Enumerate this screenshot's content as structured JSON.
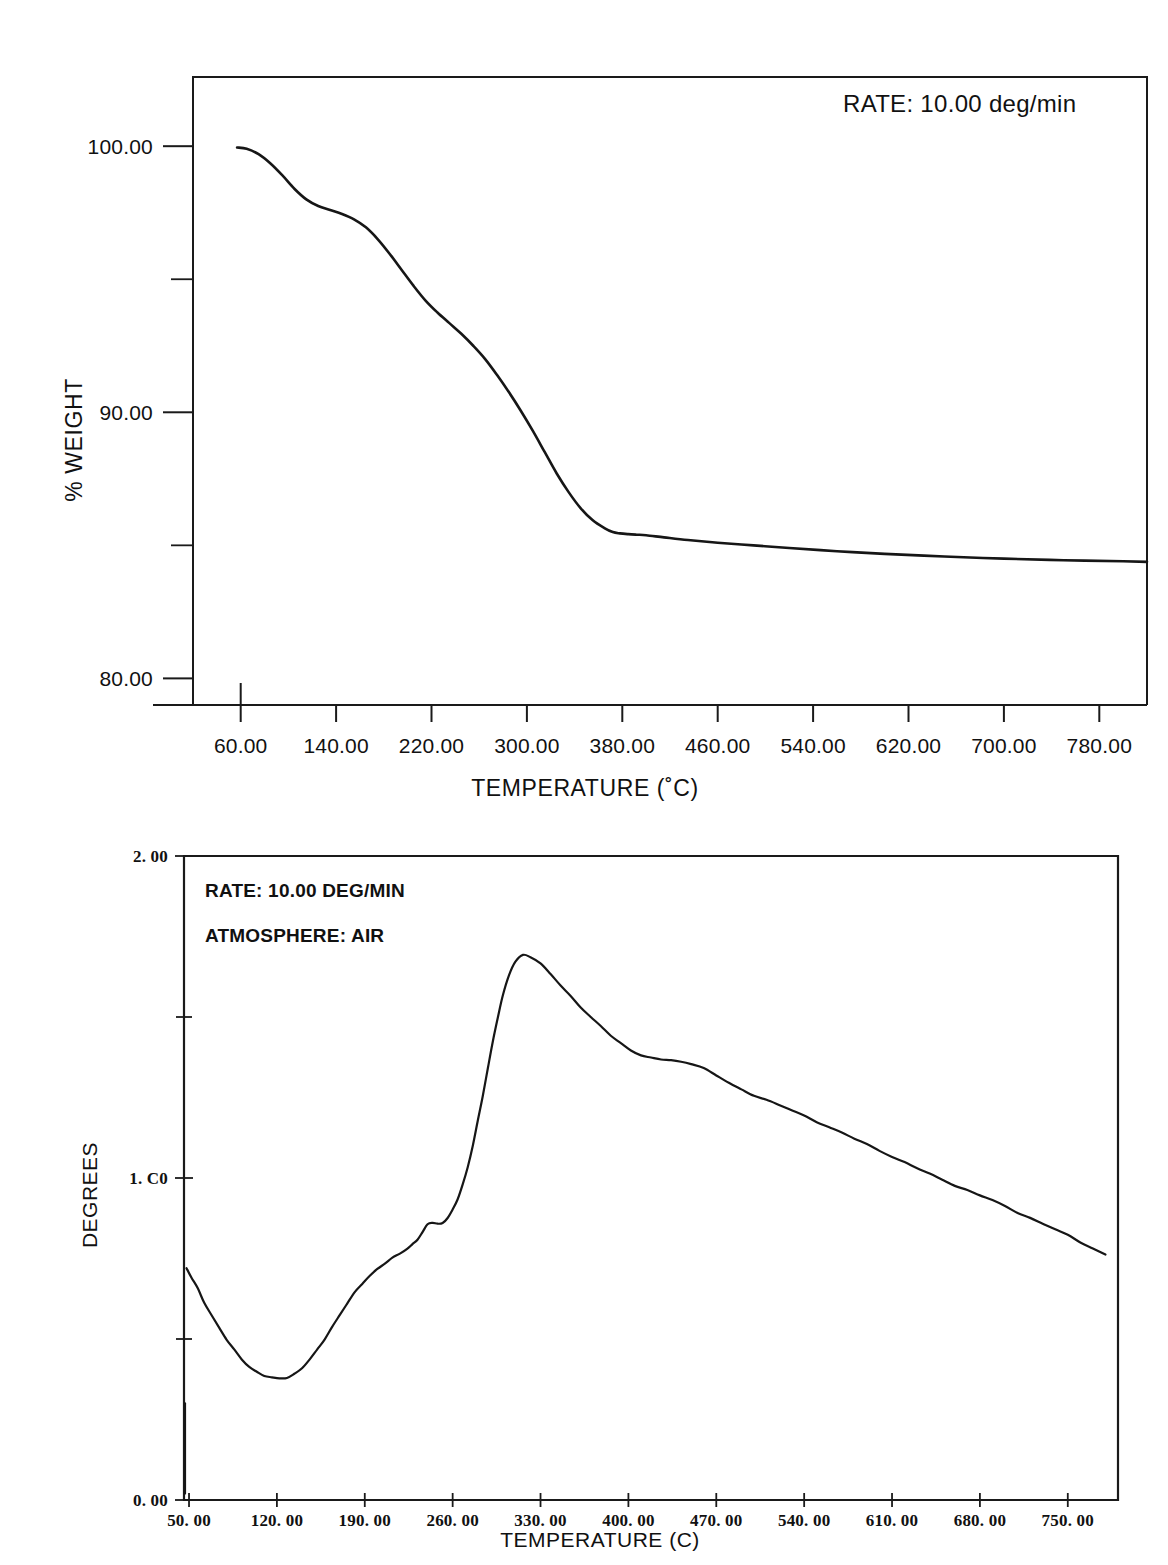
{
  "figure": {
    "background": "#ffffff",
    "ink": "#161616"
  },
  "chart_data": [
    {
      "id": "tga",
      "type": "line",
      "title": "",
      "xlabel": "TEMPERATURE  (˚C)",
      "ylabel": "% WEIGHT",
      "xlim": [
        20,
        820
      ],
      "ylim": [
        79.0,
        102.6
      ],
      "grid": false,
      "legend": "none",
      "annotations": [
        {
          "name": "rate",
          "label": "RATE:",
          "value": "10.00  deg/min",
          "text": "RATE:     10.00  deg/min"
        }
      ],
      "xticks": [
        60,
        140,
        220,
        300,
        380,
        460,
        540,
        620,
        700,
        780
      ],
      "xticklabels": [
        "60.00",
        "140.00",
        "220.00",
        "300.00",
        "380.00",
        "460.00",
        "540.00",
        "620.00",
        "700.00",
        "780.00"
      ],
      "yticks": [
        80,
        90,
        100
      ],
      "yticklabels": [
        "80.00",
        "90.00",
        "100.00"
      ],
      "yminorticks": [
        85,
        95
      ],
      "series": [
        {
          "name": "weight-loss",
          "x": [
            57,
            65,
            75,
            85,
            95,
            105,
            115,
            125,
            135,
            145,
            155,
            165,
            175,
            185,
            195,
            205,
            215,
            225,
            235,
            245,
            255,
            265,
            275,
            285,
            295,
            305,
            315,
            325,
            335,
            345,
            355,
            365,
            372,
            378,
            385,
            392,
            400,
            415,
            435,
            460,
            490,
            520,
            560,
            600,
            650,
            700,
            750,
            800,
            820
          ],
          "y": [
            99.95,
            99.9,
            99.7,
            99.35,
            98.9,
            98.4,
            98.0,
            97.75,
            97.6,
            97.45,
            97.25,
            96.95,
            96.5,
            95.95,
            95.35,
            94.75,
            94.2,
            93.75,
            93.35,
            92.95,
            92.5,
            92.0,
            91.4,
            90.75,
            90.05,
            89.3,
            88.5,
            87.7,
            87.0,
            86.4,
            85.95,
            85.65,
            85.5,
            85.45,
            85.42,
            85.4,
            85.38,
            85.3,
            85.2,
            85.1,
            85.0,
            84.9,
            84.78,
            84.68,
            84.58,
            84.5,
            84.44,
            84.4,
            84.38
          ]
        }
      ]
    },
    {
      "id": "dta",
      "type": "line",
      "title": "",
      "xlabel": "TEMPERATURE (C)",
      "ylabel": "DEGREES",
      "xlim": [
        46,
        790
      ],
      "ylim": [
        0.0,
        2.0
      ],
      "grid": false,
      "legend": "none",
      "annotations": [
        {
          "name": "rate",
          "label": "RATE:",
          "value": "10.00 DEG/MIN",
          "text": "RATE:  10.00 DEG/MIN"
        },
        {
          "name": "atmosphere",
          "label": "ATMOSPHERE:",
          "value": "AIR",
          "text": "ATMOSPHERE:  AIR"
        }
      ],
      "xticks": [
        50,
        120,
        190,
        260,
        330,
        400,
        470,
        540,
        610,
        680,
        750
      ],
      "xticklabels": [
        "50. 00",
        "120. 00",
        "190. 00",
        "260. 00",
        "330. 00",
        "400. 00",
        "470. 00",
        "540. 00",
        "610. 00",
        "680. 00",
        "750. 00"
      ],
      "yticks": [
        0.0,
        1.0,
        2.0
      ],
      "yticklabels": [
        "0. 00",
        "1. C0",
        "2. 00"
      ],
      "yminorticks": [
        0.5,
        1.5
      ],
      "series": [
        {
          "name": "dta-signal",
          "x": [
            48,
            52,
            57,
            62,
            68,
            74,
            80,
            86,
            92,
            98,
            104,
            110,
            116,
            122,
            128,
            134,
            140,
            146,
            152,
            158,
            164,
            170,
            176,
            182,
            188,
            194,
            200,
            206,
            212,
            218,
            224,
            228,
            232,
            236,
            240,
            244,
            248,
            252,
            256,
            260,
            264,
            268,
            272,
            276,
            280,
            284,
            288,
            292,
            296,
            300,
            305,
            310,
            316,
            322,
            330,
            338,
            346,
            354,
            362,
            370,
            378,
            386,
            394,
            402,
            410,
            418,
            426,
            434,
            442,
            450,
            460,
            470,
            480,
            490,
            500,
            510,
            520,
            530,
            540,
            550,
            560,
            570,
            580,
            590,
            600,
            610,
            620,
            630,
            640,
            650,
            660,
            670,
            680,
            690,
            700,
            710,
            720,
            730,
            740,
            750,
            760,
            770,
            780
          ],
          "y": [
            0.72,
            0.69,
            0.655,
            0.615,
            0.575,
            0.535,
            0.498,
            0.465,
            0.437,
            0.415,
            0.398,
            0.386,
            0.379,
            0.377,
            0.381,
            0.392,
            0.41,
            0.435,
            0.465,
            0.5,
            0.538,
            0.575,
            0.61,
            0.643,
            0.672,
            0.697,
            0.718,
            0.735,
            0.75,
            0.765,
            0.782,
            0.795,
            0.81,
            0.83,
            0.855,
            0.862,
            0.858,
            0.862,
            0.875,
            0.9,
            0.935,
            0.98,
            1.035,
            1.1,
            1.175,
            1.255,
            1.34,
            1.425,
            1.5,
            1.565,
            1.63,
            1.672,
            1.693,
            1.688,
            1.665,
            1.632,
            1.598,
            1.565,
            1.532,
            1.5,
            1.47,
            1.442,
            1.418,
            1.398,
            1.382,
            1.372,
            1.368,
            1.365,
            1.362,
            1.356,
            1.34,
            1.318,
            1.295,
            1.275,
            1.258,
            1.242,
            1.226,
            1.21,
            1.193,
            1.176,
            1.158,
            1.14,
            1.122,
            1.104,
            1.086,
            1.067,
            1.048,
            1.03,
            1.012,
            0.995,
            0.978,
            0.962,
            0.946,
            0.93,
            0.912,
            0.894,
            0.876,
            0.858,
            0.84,
            0.822,
            0.802,
            0.782,
            0.762
          ]
        }
      ]
    }
  ]
}
